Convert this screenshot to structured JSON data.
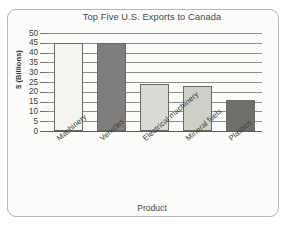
{
  "chart_data": {
    "type": "bar",
    "title": "Top Five U.S. Exports to Canada",
    "xlabel": "Product",
    "ylabel": "$ (Billions)",
    "categories": [
      "Machinery",
      "Vehicles",
      "Electrical machinery",
      "Mineral fuels",
      "Plastics"
    ],
    "values": [
      45,
      45,
      24,
      23,
      16
    ],
    "ylim": [
      0,
      50
    ],
    "ytick_labels": [
      "0",
      "5",
      "10",
      "15",
      "20",
      "25",
      "30",
      "35",
      "40",
      "45",
      "50"
    ],
    "ytick_values": [
      0,
      5,
      10,
      15,
      20,
      25,
      30,
      35,
      40,
      45,
      50
    ],
    "grid": true,
    "legend": false,
    "bar_colors": [
      "#f4f4f1",
      "#7f7e7c",
      "#d9d9d5",
      "#cfcfca",
      "#6f6f6d"
    ],
    "bar_border_color": "#6a6a67",
    "gridline_color": "#8d8d89",
    "axis_color": "#5a5a57",
    "frame_color": "#b7b7b3",
    "background_color": "#fbfbf9",
    "label_rotation": -41
  }
}
